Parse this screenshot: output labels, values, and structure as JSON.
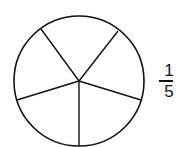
{
  "diagram": {
    "type": "fraction-circle",
    "parts": 5,
    "shaded_parts": 0,
    "stroke_color": "#111111",
    "fill_color": "#ffffff"
  },
  "fraction": {
    "numerator": "1",
    "denominator": "5"
  }
}
